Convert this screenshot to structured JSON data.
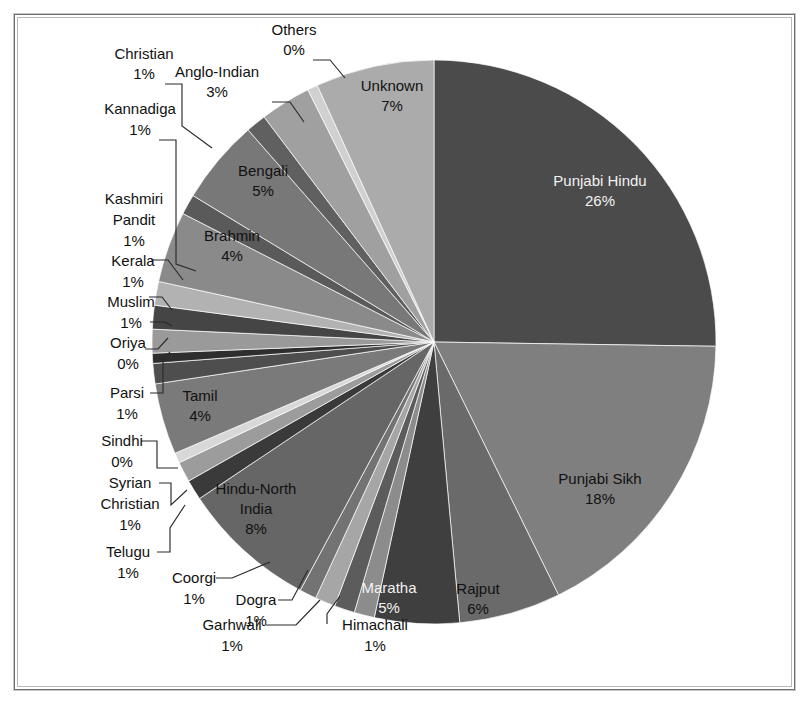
{
  "chart_data": {
    "type": "pie",
    "title": "",
    "subtitle": "",
    "xlabel": "",
    "ylabel": "",
    "legend_position": "none",
    "grid": false,
    "label_format": "name + percent",
    "start_angle_deg": 0,
    "direction": "clockwise",
    "categories": [
      "Punjabi Hindu",
      "Punjabi Sikh",
      "Rajput",
      "Maratha",
      "Himachali",
      "Garhwali",
      "Dogra",
      "Coorgi",
      "Hindu-North India",
      "Telugu",
      "Syrian Christian",
      "Sindhi",
      "Tamil",
      "Parsi",
      "Oriya",
      "Muslim",
      "Kerala",
      "Kashmiri Pandit",
      "Brahmin",
      "Kannadiga",
      "Bengali",
      "Christian",
      "Anglo-Indian",
      "Others",
      "Unknown"
    ],
    "values": [
      26,
      18,
      6,
      5,
      1,
      1,
      1,
      1,
      8,
      1,
      1,
      0,
      4,
      1,
      0,
      1,
      1,
      1,
      4,
      1,
      5,
      1,
      3,
      0,
      7
    ],
    "value_labels": [
      "26%",
      "18%",
      "6%",
      "5%",
      "1%",
      "1%",
      "1%",
      "1%",
      "8%",
      "1%",
      "1%",
      "0%",
      "4%",
      "1%",
      "0%",
      "1%",
      "1%",
      "1%",
      "4%",
      "1%",
      "5%",
      "1%",
      "3%",
      "0%",
      "7%"
    ],
    "slices": [
      {
        "name": "Punjabi Hindu",
        "percent": 26,
        "label": "26%",
        "sweep": 26.0,
        "color": "#4b4b4b",
        "label_placement": "inside",
        "label_color": "light"
      },
      {
        "name": "Punjabi Sikh",
        "percent": 18,
        "label": "18%",
        "sweep": 18.0,
        "color": "#7f7f7f",
        "label_placement": "inside",
        "label_color": "dark"
      },
      {
        "name": "Rajput",
        "percent": 6,
        "label": "6%",
        "sweep": 6.0,
        "color": "#6a6a6a",
        "label_placement": "inside",
        "label_color": "dark"
      },
      {
        "name": "Maratha",
        "percent": 5,
        "label": "5%",
        "sweep": 5.0,
        "color": "#3f3f3f",
        "label_placement": "inside",
        "label_color": "light"
      },
      {
        "name": "Himachali",
        "percent": 1,
        "label": "1%",
        "sweep": 1.2,
        "color": "#8c8c8c",
        "label_placement": "callout",
        "label_color": "dark"
      },
      {
        "name": "Garhwali",
        "percent": 1,
        "label": "1%",
        "sweep": 1.2,
        "color": "#5c5c5c",
        "label_placement": "callout",
        "label_color": "dark"
      },
      {
        "name": "Dogra",
        "percent": 1,
        "label": "1%",
        "sweep": 1.2,
        "color": "#a6a6a6",
        "label_placement": "callout",
        "label_color": "dark"
      },
      {
        "name": "Coorgi",
        "percent": 1,
        "label": "1%",
        "sweep": 1.0,
        "color": "#737373",
        "label_placement": "callout",
        "label_color": "dark"
      },
      {
        "name": "Hindu-North India",
        "percent": 8,
        "label": "8%",
        "sweep": 8.0,
        "color": "#666666",
        "label_placement": "inside",
        "label_color": "dark"
      },
      {
        "name": "Telugu",
        "percent": 1,
        "label": "1%",
        "sweep": 1.2,
        "color": "#3a3a3a",
        "label_placement": "callout",
        "label_color": "dark"
      },
      {
        "name": "Syrian Christian",
        "percent": 1,
        "label": "1%",
        "sweep": 1.2,
        "color": "#9c9c9c",
        "label_placement": "callout",
        "label_color": "dark"
      },
      {
        "name": "Sindhi",
        "percent": 0,
        "label": "0%",
        "sweep": 0.6,
        "color": "#d8d8d8",
        "label_placement": "callout",
        "label_color": "dark"
      },
      {
        "name": "Tamil",
        "percent": 4,
        "label": "4%",
        "sweep": 4.2,
        "color": "#7a7a7a",
        "label_placement": "inside",
        "label_color": "dark"
      },
      {
        "name": "Parsi",
        "percent": 1,
        "label": "1%",
        "sweep": 1.2,
        "color": "#4e4e4e",
        "label_placement": "callout",
        "label_color": "dark"
      },
      {
        "name": "Oriya",
        "percent": 0,
        "label": "0%",
        "sweep": 0.6,
        "color": "#2e2e2e",
        "label_placement": "callout",
        "label_color": "dark"
      },
      {
        "name": "Muslim",
        "percent": 1,
        "label": "1%",
        "sweep": 1.4,
        "color": "#9a9a9a",
        "label_placement": "callout",
        "label_color": "dark"
      },
      {
        "name": "Kerala",
        "percent": 1,
        "label": "1%",
        "sweep": 1.4,
        "color": "#454545",
        "label_placement": "callout",
        "label_color": "dark"
      },
      {
        "name": "Kashmiri Pandit",
        "percent": 1,
        "label": "1%",
        "sweep": 1.4,
        "color": "#b2b2b2",
        "label_placement": "callout",
        "label_color": "dark"
      },
      {
        "name": "Brahmin",
        "percent": 4,
        "label": "4%",
        "sweep": 4.2,
        "color": "#8a8a8a",
        "label_placement": "inside",
        "label_color": "dark"
      },
      {
        "name": "Kannadiga",
        "percent": 1,
        "label": "1%",
        "sweep": 1.2,
        "color": "#5a5a5a",
        "label_placement": "callout",
        "label_color": "dark"
      },
      {
        "name": "Bengali",
        "percent": 5,
        "label": "5%",
        "sweep": 5.0,
        "color": "#787878",
        "label_placement": "inside",
        "label_color": "dark"
      },
      {
        "name": "Christian",
        "percent": 1,
        "label": "1%",
        "sweep": 1.2,
        "color": "#606060",
        "label_placement": "callout",
        "label_color": "dark"
      },
      {
        "name": "Anglo-Indian",
        "percent": 3,
        "label": "3%",
        "sweep": 3.0,
        "color": "#a0a0a0",
        "label_placement": "callout",
        "label_color": "dark"
      },
      {
        "name": "Others",
        "percent": 0,
        "label": "0%",
        "sweep": 0.6,
        "color": "#d0d0d0",
        "label_placement": "callout",
        "label_color": "dark"
      },
      {
        "name": "Unknown",
        "percent": 7,
        "label": "7%",
        "sweep": 7.0,
        "color": "#ababab",
        "label_placement": "inside",
        "label_color": "dark"
      }
    ]
  },
  "labels": {
    "punjabi_hindu": {
      "name": "Punjabi Hindu",
      "pct": "26%"
    },
    "punjabi_sikh": {
      "name": "Punjabi Sikh",
      "pct": "18%"
    },
    "rajput": {
      "name": "Rajput",
      "pct": "6%"
    },
    "maratha": {
      "name": "Maratha",
      "pct": "5%"
    },
    "himachali": {
      "name": "Himachali",
      "pct": "1%"
    },
    "garhwali": {
      "name": "Garhwali",
      "pct": "1%"
    },
    "dogra": {
      "name": "Dogra",
      "pct": "1%"
    },
    "coorgi": {
      "name": "Coorgi",
      "pct": "1%"
    },
    "hindu_north_india": {
      "name1": "Hindu-North",
      "name2": "India",
      "pct": "8%"
    },
    "telugu": {
      "name": "Telugu",
      "pct": "1%"
    },
    "syrian_christian": {
      "name1": "Syrian",
      "name2": "Christian",
      "pct": "1%"
    },
    "sindhi": {
      "name": "Sindhi",
      "pct": "0%"
    },
    "tamil": {
      "name": "Tamil",
      "pct": "4%"
    },
    "parsi": {
      "name": "Parsi",
      "pct": "1%"
    },
    "oriya": {
      "name": "Oriya",
      "pct": "0%"
    },
    "muslim": {
      "name": "Muslim",
      "pct": "1%"
    },
    "kerala": {
      "name": "Kerala",
      "pct": "1%"
    },
    "kashmiri_pandit": {
      "name1": "Kashmiri",
      "name2": "Pandit",
      "pct": "1%"
    },
    "brahmin": {
      "name": "Brahmin",
      "pct": "4%"
    },
    "kannadiga": {
      "name": "Kannadiga",
      "pct": "1%"
    },
    "bengali": {
      "name": "Bengali",
      "pct": "5%"
    },
    "christian": {
      "name": "Christian",
      "pct": "1%"
    },
    "anglo_indian": {
      "name": "Anglo-Indian",
      "pct": "3%"
    },
    "others": {
      "name": "Others",
      "pct": "0%"
    },
    "unknown": {
      "name": "Unknown",
      "pct": "7%"
    }
  },
  "colors": {
    "background": "#ffffff",
    "frame": "#6d6d6d",
    "text": "#111111",
    "text_light": "#f2f2f2",
    "leader": "#2a2a2a"
  }
}
